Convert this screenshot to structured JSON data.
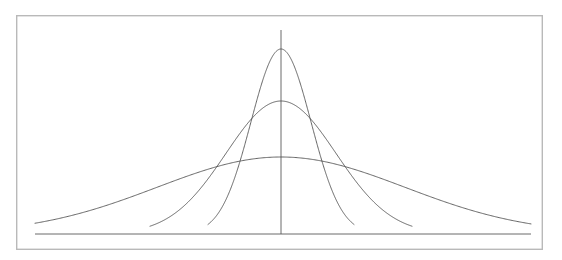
{
  "figure": {
    "title": "",
    "background_color": "#ffffff",
    "frame_color": "#b9b9b9",
    "line_color": "#4a4a4a",
    "axis_color": "#5a5a5a",
    "frame": {
      "x": 16,
      "y": 15,
      "width": 527,
      "height": 235
    }
  },
  "chart_data": {
    "type": "line",
    "title": "",
    "subtitle": "",
    "xlabel": "",
    "ylabel": "",
    "grid": false,
    "legend": "none",
    "annotations": [],
    "xlim": [
      -5,
      5
    ],
    "ylim": [
      0,
      1
    ],
    "mean": 0,
    "axis_lines": {
      "baseline": {
        "x_start": 35,
        "x_end": 531,
        "y": 234
      },
      "center_axis": {
        "x": 281,
        "y_top": 30,
        "y_bottom": 234
      }
    },
    "pixel_geometry": {
      "center_x": 281,
      "baseline_y": 234,
      "left_edge_x": 35,
      "right_edge_x": 531
    },
    "series": [
      {
        "name": "narrow",
        "sigma": 0.45,
        "peak_value": 1.0,
        "peak_pixel_y": 49,
        "half_width_pixels": 60,
        "amplitude_pixels": 185,
        "tail_start_x": 208,
        "tail_end_x": 354
      },
      {
        "name": "medium",
        "sigma": 0.82,
        "peak_value": 0.72,
        "peak_pixel_y": 101,
        "half_width_pixels": 110,
        "amplitude_pixels": 133,
        "tail_start_x": 150,
        "tail_end_x": 412
      },
      {
        "name": "wide",
        "sigma": 1.85,
        "peak_value": 0.395,
        "peak_pixel_y": 157,
        "half_width_pixels": 248,
        "amplitude_pixels": 77,
        "tail_start_x": 35,
        "tail_end_x": 531
      }
    ]
  }
}
